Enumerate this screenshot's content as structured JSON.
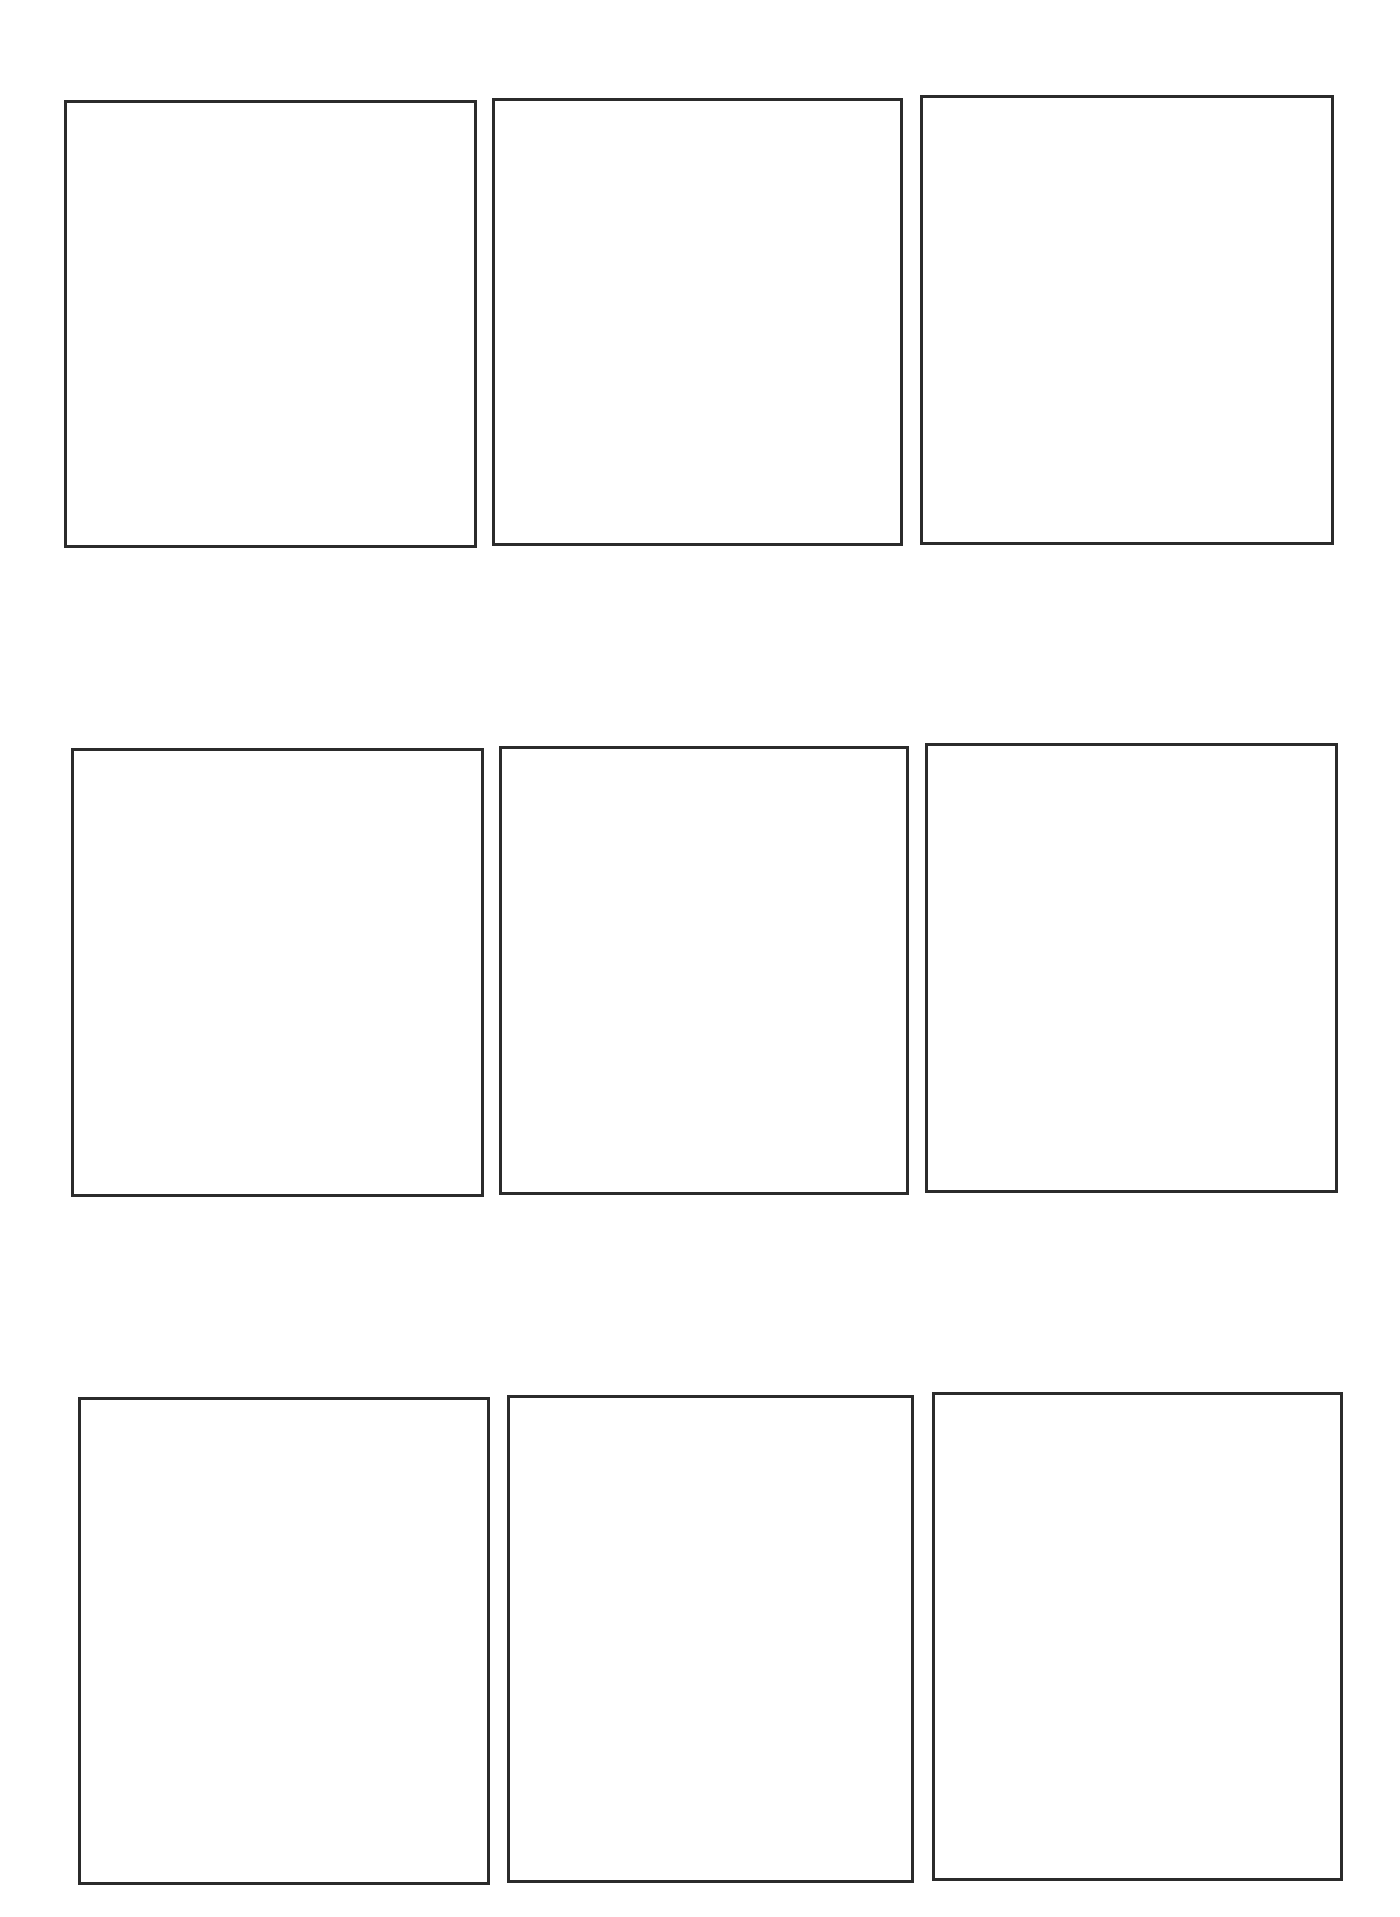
{
  "template": {
    "type": "3x3 blank panel grid",
    "rows": 3,
    "columns": 3,
    "border_color": "#2b2b2b",
    "background_color": "#ffffff"
  },
  "panels": [
    {
      "row": 1,
      "col": 1,
      "content": ""
    },
    {
      "row": 1,
      "col": 2,
      "content": ""
    },
    {
      "row": 1,
      "col": 3,
      "content": ""
    },
    {
      "row": 2,
      "col": 1,
      "content": ""
    },
    {
      "row": 2,
      "col": 2,
      "content": ""
    },
    {
      "row": 2,
      "col": 3,
      "content": ""
    },
    {
      "row": 3,
      "col": 1,
      "content": ""
    },
    {
      "row": 3,
      "col": 2,
      "content": ""
    },
    {
      "row": 3,
      "col": 3,
      "content": ""
    }
  ]
}
